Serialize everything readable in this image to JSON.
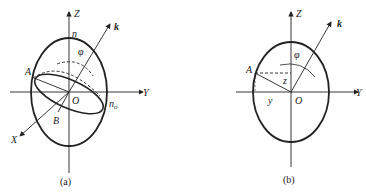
{
  "figure": {
    "panel_a": {
      "caption": "(a)",
      "axes": {
        "z": "Z",
        "y": "Y",
        "x": "X"
      },
      "labels": {
        "k": "k",
        "n": "n",
        "phi": "φ",
        "A": "A",
        "O": "O",
        "B": "B",
        "n_o": "n",
        "n_o_sub": "o"
      }
    },
    "panel_b": {
      "caption": "(b)",
      "axes": {
        "z": "Z",
        "y": "Y"
      },
      "labels": {
        "k": "k",
        "phi": "φ",
        "A": "A",
        "z": "z",
        "y": "y",
        "O": "O"
      }
    },
    "colors": {
      "stroke": "#222222",
      "background": "#ffffff"
    }
  }
}
